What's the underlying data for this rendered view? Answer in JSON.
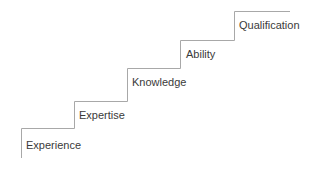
{
  "diagram": {
    "type": "staircase",
    "line_color": "#a8a8a8",
    "text_color": "#3a3a3a",
    "steps": [
      {
        "label": "Experience"
      },
      {
        "label": "Expertise"
      },
      {
        "label": "Knowledge"
      },
      {
        "label": "Ability"
      },
      {
        "label": "Qualification"
      }
    ]
  }
}
